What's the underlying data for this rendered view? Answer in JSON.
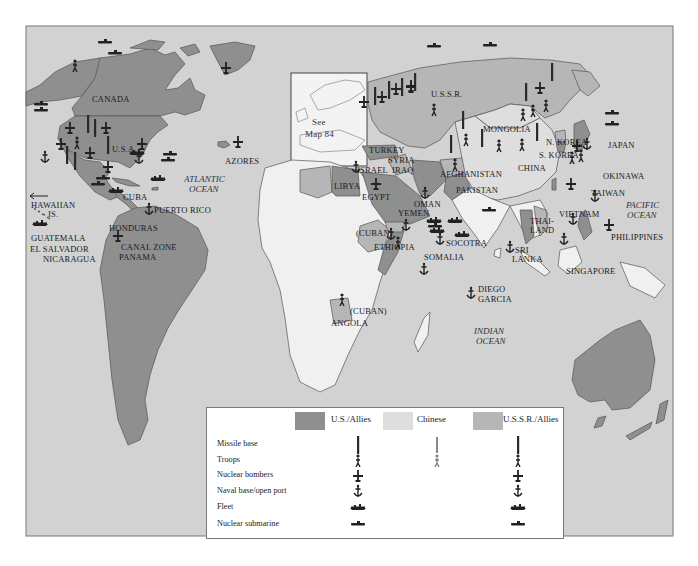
{
  "colors": {
    "ocean": "#d2d2d2",
    "us_allies": "#8f8f8f",
    "ussr_allies": "#b6b6b6",
    "chinese": "#dedede",
    "neutral": "#f0f0f0",
    "frame": "#777777",
    "icon": "#222222"
  },
  "map": {
    "inset_label_line1": "See",
    "inset_label_line2": "Map 84",
    "countries": {
      "canada": "CANADA",
      "usa": "U.S.A.",
      "azores": "AZORES",
      "hawaiian_line1": "HAWAIIAN",
      "hawaiian_line2": "IS.",
      "cuba": "CUBA",
      "puerto_rico": "PUERTO RICO",
      "honduras": "HONDURAS",
      "guatemala": "GUATEMALA",
      "el_salvador": "EL SALVADOR",
      "nicaragua": "NICARAGUA",
      "canal_zone": "CANAL ZONE",
      "panama": "PANAMA",
      "ussr": "U.S.S.R.",
      "mongolia": "MONGOLIA",
      "china": "CHINA",
      "n_korea": "N. KOREA",
      "s_korea": "S. KOREA",
      "japan": "JAPAN",
      "okinawa": "OKINAWA",
      "taiwan": "TAIWAN",
      "turkey": "TURKEY",
      "syria": "SYRIA",
      "iraq": "IRAQ",
      "israel": "ISRAEL",
      "libya": "LIBYA",
      "egypt": "EGYPT",
      "afghanistan": "AFGHANISTAN",
      "pakistan": "PAKISTAN",
      "oman": "OMAN",
      "yemen": "YEMEN",
      "cuban_ethiopia": "(CUBAN)",
      "ethiopia": "ETHIOPIA",
      "socotra": "SOCOTRA",
      "somalia": "SOMALIA",
      "diego_line1": "DIEGO",
      "diego_line2": "GARCIA",
      "sri_line1": "SRI",
      "sri_line2": "LANKA",
      "thai_line1": "THAI-",
      "thai_line2": "LAND",
      "vietnam": "VIETNAM",
      "philippines": "PHILIPPINES",
      "singapore": "SINGAPORE",
      "cuban_angola": "(CUBAN)",
      "angola": "ANGOLA"
    },
    "oceans": {
      "atlantic_line1": "ATLANTIC",
      "atlantic_line2": "OCEAN",
      "pacific_line1": "PACIFIC",
      "pacific_line2": "OCEAN",
      "indian_line1": "INDIAN",
      "indian_line2": "OCEAN"
    }
  },
  "legend": {
    "columns": [
      {
        "label": "U.S./Allies",
        "swatch_color_key": "us_allies"
      },
      {
        "label": "Chinese",
        "swatch_color_key": "chinese"
      },
      {
        "label": "U.S.S.R./Allies",
        "swatch_color_key": "ussr_allies"
      }
    ],
    "rows": [
      {
        "label": "Missile base",
        "icon": "missile-icon",
        "us": true,
        "chinese": true,
        "ussr": true
      },
      {
        "label": "Troops",
        "icon": "troops-icon",
        "us": true,
        "chinese": true,
        "ussr": true
      },
      {
        "label": "Nuclear bombers",
        "icon": "bomber-icon",
        "us": true,
        "chinese": false,
        "ussr": true
      },
      {
        "label": "Naval base/open port",
        "icon": "anchor-icon",
        "us": true,
        "chinese": false,
        "ussr": true
      },
      {
        "label": "Fleet",
        "icon": "fleet-icon",
        "us": true,
        "chinese": false,
        "ussr": true
      },
      {
        "label": "Nuclear submarine",
        "icon": "submarine-icon",
        "us": true,
        "chinese": false,
        "ussr": true
      }
    ]
  }
}
